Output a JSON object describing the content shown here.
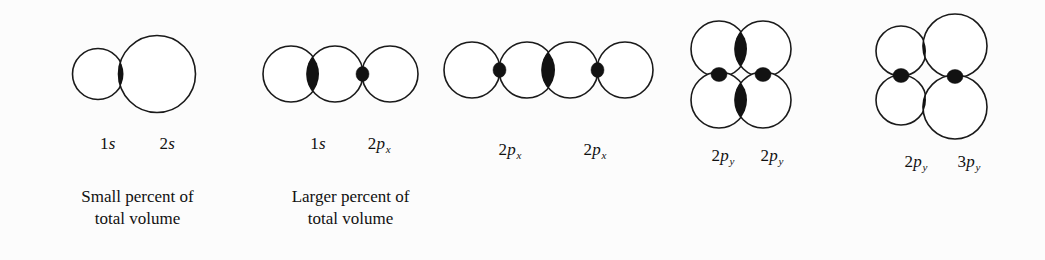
{
  "figure": {
    "background_color": "#fcfcfc",
    "ink_color": "#121212",
    "overlap_fill_color": "#121212"
  },
  "panels": [
    {
      "id": "1s-2s",
      "labels": [
        {
          "num": "1",
          "sym": "s",
          "sub": ""
        },
        {
          "num": "2",
          "sym": "s",
          "sub": ""
        }
      ],
      "caption_lines": [
        "Small percent of",
        "total volume"
      ]
    },
    {
      "id": "1s-2px",
      "labels": [
        {
          "num": "1",
          "sym": "s",
          "sub": ""
        },
        {
          "num": "2",
          "sym": "p",
          "sub": "x"
        }
      ],
      "caption_lines": [
        "Larger percent of",
        "total volume"
      ]
    },
    {
      "id": "2px-2px",
      "labels": [
        {
          "num": "2",
          "sym": "p",
          "sub": "x"
        },
        {
          "num": "2",
          "sym": "p",
          "sub": "x"
        }
      ],
      "caption_lines": []
    },
    {
      "id": "2py-2py",
      "labels": [
        {
          "num": "2",
          "sym": "p",
          "sub": "y"
        },
        {
          "num": "2",
          "sym": "p",
          "sub": "y"
        }
      ],
      "caption_lines": []
    },
    {
      "id": "2py-3py",
      "labels": [
        {
          "num": "2",
          "sym": "p",
          "sub": "y"
        },
        {
          "num": "3",
          "sym": "p",
          "sub": "y"
        }
      ],
      "caption_lines": []
    }
  ]
}
